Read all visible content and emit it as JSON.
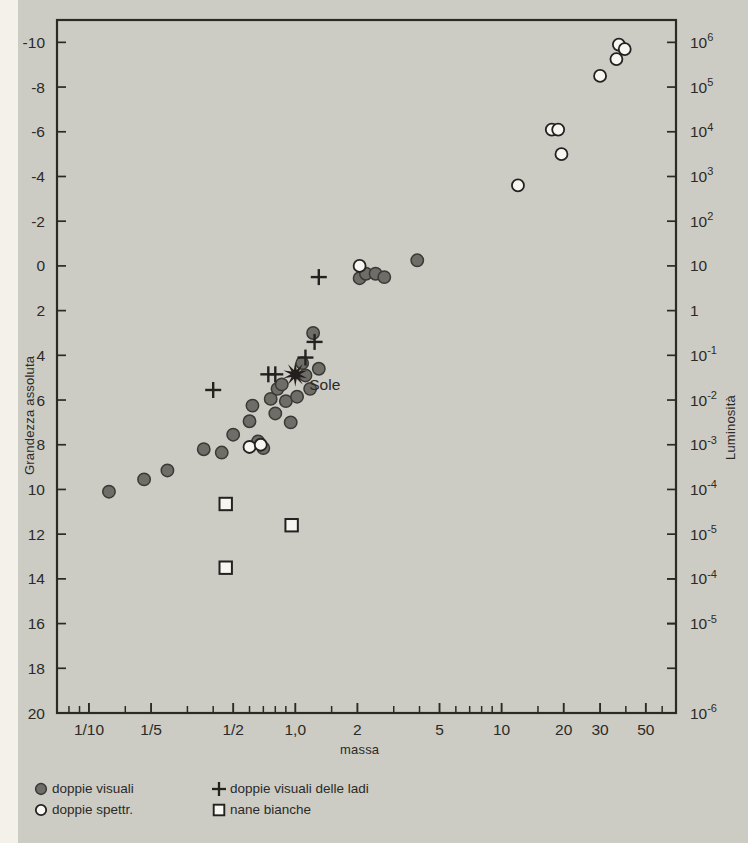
{
  "figure": {
    "background_color": "#cdccc4",
    "ink_color": "#2b2a27",
    "marker_fill_color": "#6e6d68",
    "marker_open_color": "#f7f6f2"
  },
  "chart_data": {
    "type": "scatter",
    "title": "",
    "xlabel": "massa",
    "ylabel": "Grandezza assoluta",
    "ylabel_right": "Luminosità",
    "grid": false,
    "xscale": "log",
    "xlim": [
      0.07,
      70
    ],
    "ylim": [
      20,
      -11
    ],
    "xticks": [
      {
        "value": 0.1,
        "label": "1/10"
      },
      {
        "value": 0.2,
        "label": "1/5"
      },
      {
        "value": 0.5,
        "label": "1/2"
      },
      {
        "value": 1.0,
        "label": "1,0"
      },
      {
        "value": 2.0,
        "label": "2"
      },
      {
        "value": 5.0,
        "label": "5"
      },
      {
        "value": 10.0,
        "label": "10"
      },
      {
        "value": 20.0,
        "label": "20"
      },
      {
        "value": 30.0,
        "label": "30"
      },
      {
        "value": 50.0,
        "label": "50"
      }
    ],
    "xminorticks": [
      0.08,
      0.09,
      0.15,
      0.3,
      0.4,
      0.6,
      0.7,
      0.8,
      0.9,
      1.5,
      3,
      4,
      6,
      7,
      8,
      9,
      15,
      40,
      60
    ],
    "yticks": [
      {
        "value": -10,
        "label": "-10",
        "right_label": "106",
        "right_exp": "6"
      },
      {
        "value": -8,
        "label": "-8",
        "right_label": "105",
        "right_exp": "5"
      },
      {
        "value": -6,
        "label": "-6",
        "right_label": "104",
        "right_exp": "4"
      },
      {
        "value": -4,
        "label": "-4",
        "right_label": "103",
        "right_exp": "3"
      },
      {
        "value": -2,
        "label": "-2",
        "right_label": "102",
        "right_exp": "2"
      },
      {
        "value": 0,
        "label": "0",
        "right_label": "10",
        "right_exp": ""
      },
      {
        "value": 2,
        "label": "2",
        "right_label": "1",
        "right_exp": ""
      },
      {
        "value": 4,
        "label": "4",
        "right_label": "10-1",
        "right_exp": "-1"
      },
      {
        "value": 6,
        "label": "6",
        "right_label": "10-2",
        "right_exp": "-2"
      },
      {
        "value": 8,
        "label": "8",
        "right_label": "10-3",
        "right_exp": "-3"
      },
      {
        "value": 10,
        "label": "10",
        "right_label": "10-4",
        "right_exp": "-4"
      },
      {
        "value": 12,
        "label": "12",
        "right_label": "10-5",
        "right_exp": "-5"
      },
      {
        "value": 14,
        "label": "14",
        "right_label": "",
        "right_exp": ""
      },
      {
        "value": 16,
        "label": "16",
        "right_label": "",
        "right_exp": ""
      },
      {
        "value": 18,
        "label": "18",
        "right_label": "",
        "right_exp": ""
      },
      {
        "value": 20,
        "label": "20",
        "right_label": "10-6",
        "right_exp": "-6"
      }
    ],
    "yticks_right_extra": [
      {
        "value": 14,
        "right_label": "10-4",
        "right_exp": "-4"
      },
      {
        "value": 16,
        "right_label": "10-5",
        "right_exp": "-5"
      }
    ],
    "series": [
      {
        "name": "doppie visuali",
        "marker": "filled-circle",
        "points": [
          [
            0.125,
            10.1
          ],
          [
            0.185,
            9.55
          ],
          [
            0.24,
            9.15
          ],
          [
            0.36,
            8.2
          ],
          [
            0.44,
            8.35
          ],
          [
            0.5,
            7.55
          ],
          [
            0.6,
            6.95
          ],
          [
            0.62,
            6.25
          ],
          [
            0.66,
            7.85
          ],
          [
            0.7,
            8.15
          ],
          [
            0.76,
            5.95
          ],
          [
            0.8,
            6.6
          ],
          [
            0.82,
            5.5
          ],
          [
            0.86,
            5.3
          ],
          [
            0.9,
            6.05
          ],
          [
            0.95,
            7.0
          ],
          [
            1.02,
            5.85
          ],
          [
            1.08,
            4.35
          ],
          [
            1.12,
            4.9
          ],
          [
            1.18,
            5.5
          ],
          [
            1.22,
            3.0
          ],
          [
            1.3,
            4.6
          ],
          [
            2.05,
            0.55
          ],
          [
            2.2,
            0.35
          ],
          [
            2.45,
            0.35
          ],
          [
            2.7,
            0.5
          ],
          [
            3.9,
            -0.25
          ]
        ]
      },
      {
        "name": "doppie spettr.",
        "marker": "open-circle",
        "points": [
          [
            0.6,
            8.1
          ],
          [
            0.68,
            8.0
          ],
          [
            2.05,
            0.0
          ],
          [
            12.0,
            -3.6
          ],
          [
            17.5,
            -6.1
          ],
          [
            18.8,
            -6.1
          ],
          [
            19.5,
            -5.0
          ],
          [
            30.0,
            -8.5
          ],
          [
            37.0,
            -9.9
          ],
          [
            39.5,
            -9.7
          ],
          [
            36.0,
            -9.25
          ]
        ]
      },
      {
        "name": "doppie visuali delle ladi",
        "marker": "plus",
        "points": [
          [
            0.4,
            5.55
          ],
          [
            0.74,
            4.85
          ],
          [
            0.8,
            4.85
          ],
          [
            1.12,
            4.1
          ],
          [
            1.24,
            3.4
          ],
          [
            1.3,
            0.5
          ]
        ]
      },
      {
        "name": "nane bianche",
        "marker": "open-square",
        "points": [
          [
            0.46,
            10.65
          ],
          [
            0.46,
            13.5
          ],
          [
            0.96,
            11.6
          ]
        ]
      }
    ],
    "annotations": [
      {
        "label": "Sole",
        "marker": "starburst",
        "x": 1.0,
        "y": 4.85,
        "label_dx": 14,
        "label_dy": 16
      }
    ],
    "legend_position": "below-left",
    "legend_layout": [
      [
        {
          "marker": "filled-circle",
          "label": "doppie visuali"
        },
        {
          "marker": "plus",
          "label": "doppie visuali delle ladi"
        }
      ],
      [
        {
          "marker": "open-circle",
          "label": "doppie spettr."
        },
        {
          "marker": "open-square",
          "label": "nane bianche"
        }
      ]
    ]
  }
}
